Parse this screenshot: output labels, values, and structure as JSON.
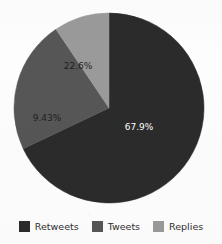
{
  "chart_data": {
    "type": "pie",
    "title": "",
    "subtitle": "",
    "xlabel": "",
    "ylabel": "",
    "grid": false,
    "legend_position": "bottom",
    "start_angle_oclock": 12,
    "direction": "clockwise",
    "categories": [
      "Retweets",
      "Tweets",
      "Replies"
    ],
    "values": [
      67.9,
      22.6,
      9.43
    ],
    "value_unit": "%",
    "data_labels": [
      "67.9%",
      "22.6%",
      "9.43%"
    ],
    "colors": [
      "#2b2b2b",
      "#565656",
      "#9a9a9a"
    ],
    "label_text_colors": [
      "#ffffff",
      "#1e1e1e",
      "#1e1e1e"
    ],
    "slices": [
      {
        "name": "Retweets",
        "value": 67.9,
        "label": "67.9%",
        "color": "#2b2b2b",
        "label_color": "#ffffff",
        "label_x": 139,
        "label_y": 127
      },
      {
        "name": "Tweets",
        "value": 22.6,
        "label": "22.6%",
        "color": "#565656",
        "label_color": "#1e1e1e",
        "label_x": 78,
        "label_y": 66
      },
      {
        "name": "Replies",
        "value": 9.43,
        "label": "9.43%",
        "color": "#9a9a9a",
        "label_color": "#1e1e1e",
        "label_x": 47,
        "label_y": 118
      }
    ]
  },
  "legend": {
    "items": [
      {
        "label": "Retweets",
        "color": "#2b2b2b"
      },
      {
        "label": "Tweets",
        "color": "#565656"
      },
      {
        "label": "Replies",
        "color": "#9a9a9a"
      }
    ]
  },
  "figure": {
    "background": "#fdfdfd",
    "center_x": 109,
    "center_y": 108,
    "radius": 95
  }
}
